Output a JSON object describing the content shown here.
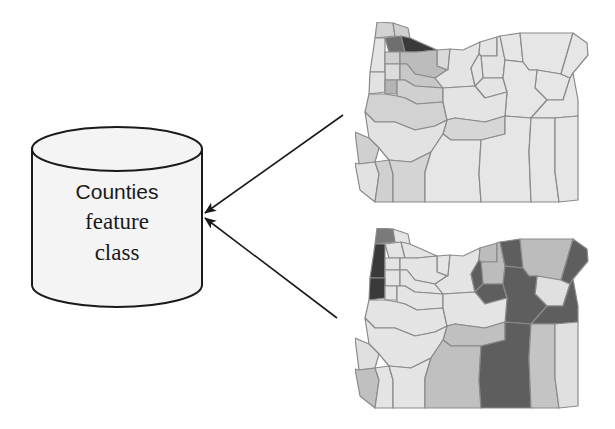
{
  "diagram": {
    "database": {
      "shape": "cylinder",
      "label_lines": [
        "Counties",
        "feature",
        "class"
      ]
    },
    "arrows": [
      {
        "from": "map-top",
        "to": "database"
      },
      {
        "from": "map-bottom",
        "to": "database"
      }
    ],
    "maps": [
      {
        "name": "oregon-counties-map-top",
        "fills": {
          "clatsop": "#d2d2d2",
          "columbia": "#d0d0d0",
          "tillamook": "#e4e4e4",
          "washington": "#6e6e6e",
          "multnomah": "#3a3a3a",
          "hood": "#dadada",
          "yamhill": "#d0d0d0",
          "clackamas": "#bcbcbc",
          "polk": "#dcdcdc",
          "marion": "#c8c8c8",
          "lincoln": "#e2e2e2",
          "benton": "#b4b4b4",
          "linn": "#d0d0d0",
          "lane": "#d2d2d2",
          "wasco": "#e4e4e4",
          "sherman": "#e4e4e4",
          "gilliam": "#e4e4e4",
          "morrow": "#e6e6e6",
          "umatilla": "#e6e6e6",
          "union": "#e6e6e6",
          "wallowa": "#e6e6e6",
          "jefferson": "#e4e4e4",
          "wheeler": "#e4e4e4",
          "grant": "#e6e6e6",
          "baker": "#e6e6e6",
          "crook": "#e4e4e4",
          "deschutes": "#d6d6d6",
          "douglas": "#e2e2e2",
          "coos": "#d0d0d0",
          "curry": "#e2e2e2",
          "josephine": "#d0d0d0",
          "jackson": "#d4d4d4",
          "klamath": "#e6e6e6",
          "lake": "#e6e6e6",
          "harney": "#e6e6e6",
          "malheur": "#e6e6e6"
        }
      },
      {
        "name": "oregon-counties-map-bottom",
        "fills": {
          "clatsop": "#7a7a7a",
          "columbia": "#e4e4e4",
          "tillamook": "#3a3a3a",
          "washington": "#e4e4e4",
          "multnomah": "#e4e4e4",
          "hood": "#e4e4e4",
          "yamhill": "#e4e4e4",
          "clackamas": "#e4e4e4",
          "polk": "#e4e4e4",
          "marion": "#e4e4e4",
          "lincoln": "#3a3a3a",
          "benton": "#e4e4e4",
          "linn": "#e4e4e4",
          "lane": "#e4e4e4",
          "wasco": "#e4e4e4",
          "sherman": "#bcbcbc",
          "gilliam": "#bcbcbc",
          "morrow": "#5e5e5e",
          "umatilla": "#bcbcbc",
          "union": "#e0e0e0",
          "wallowa": "#5e5e5e",
          "jefferson": "#5e5e5e",
          "wheeler": "#5e5e5e",
          "grant": "#5e5e5e",
          "baker": "#5e5e5e",
          "crook": "#e4e4e4",
          "deschutes": "#c0c0c0",
          "douglas": "#e4e4e4",
          "coos": "#e0e0e0",
          "curry": "#c0c0c0",
          "josephine": "#e4e4e4",
          "jackson": "#e4e4e4",
          "klamath": "#c0c0c0",
          "lake": "#5e5e5e",
          "harney": "#c4c4c4",
          "malheur": "#e0e0e0"
        }
      }
    ],
    "colors": {
      "stroke": "#1a1a1a",
      "cylinder_fill": "#f4f4f4",
      "county_border": "#8a8a8a"
    }
  }
}
